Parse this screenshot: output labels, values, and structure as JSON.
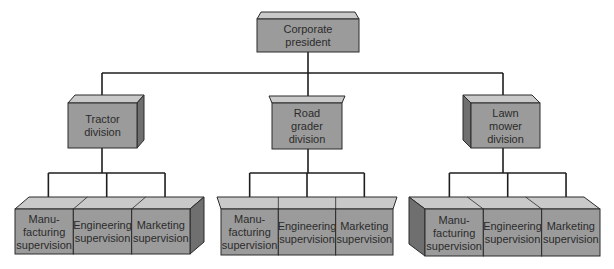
{
  "colors": {
    "top_face": "#c9c9c9",
    "front_face": "#9b9b9b",
    "side_face": "#6f6f6f",
    "edge": "#2a2a2a",
    "text": "#2b2b2b",
    "line": "#1e1e1e",
    "background": "#ffffff"
  },
  "root": {
    "label_lines": [
      "Corporate",
      "president"
    ]
  },
  "divisions": [
    {
      "id": "tractor",
      "label_lines": [
        "Tractor",
        "division"
      ],
      "supervisions": [
        {
          "label_lines": [
            "Manu-",
            "facturing",
            "supervision"
          ]
        },
        {
          "label_lines": [
            "Engineering",
            "supervision"
          ]
        },
        {
          "label_lines": [
            "Marketing",
            "supervision"
          ]
        }
      ]
    },
    {
      "id": "road-grader",
      "label_lines": [
        "Road",
        "grader",
        "division"
      ],
      "supervisions": [
        {
          "label_lines": [
            "Manu-",
            "facturing",
            "supervision"
          ]
        },
        {
          "label_lines": [
            "Engineering",
            "supervision"
          ]
        },
        {
          "label_lines": [
            "Marketing",
            "supervision"
          ]
        }
      ]
    },
    {
      "id": "lawn-mower",
      "label_lines": [
        "Lawn",
        "mower",
        "division"
      ],
      "supervisions": [
        {
          "label_lines": [
            "Manu-",
            "facturing",
            "supervision"
          ]
        },
        {
          "label_lines": [
            "Engineering",
            "supervision"
          ]
        },
        {
          "label_lines": [
            "Marketing",
            "supervision"
          ]
        }
      ]
    }
  ]
}
